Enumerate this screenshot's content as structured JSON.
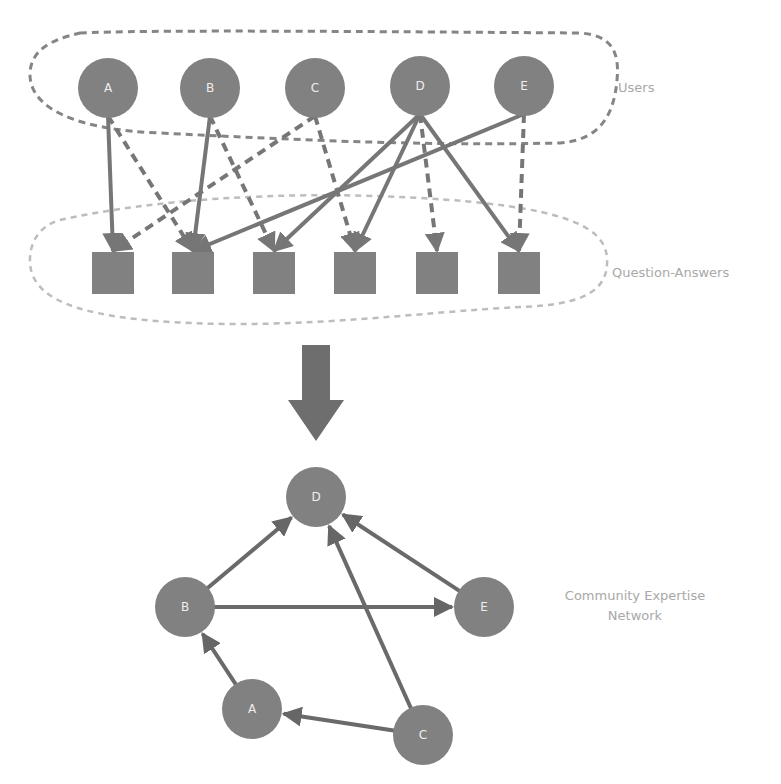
{
  "diagram": {
    "colors": {
      "node_fill": "#818181",
      "edge": "#767676",
      "edge_dark": "#6a6a6a",
      "users_outline": "#858585",
      "qa_outline": "#bdbdbd",
      "big_arrow": "#6e6e6e",
      "label_text": "#a8a8a8",
      "node_text": "#eeeeee"
    },
    "top_section": {
      "users_group": {
        "label": "Users",
        "nodes": [
          {
            "id": "A",
            "label": "A",
            "x": 108,
            "y": 88
          },
          {
            "id": "B",
            "label": "B",
            "x": 210,
            "y": 88
          },
          {
            "id": "C",
            "label": "C",
            "x": 315,
            "y": 88
          },
          {
            "id": "D",
            "label": "D",
            "x": 420,
            "y": 86
          },
          {
            "id": "E",
            "label": "E",
            "x": 524,
            "y": 86
          }
        ]
      },
      "qa_group": {
        "label": "Question-Answers",
        "items": [
          {
            "id": "Q1",
            "x": 113,
            "y": 273
          },
          {
            "id": "Q2",
            "x": 193,
            "y": 273
          },
          {
            "id": "Q3",
            "x": 274,
            "y": 273
          },
          {
            "id": "Q4",
            "x": 355,
            "y": 273
          },
          {
            "id": "Q5",
            "x": 437,
            "y": 273
          },
          {
            "id": "Q6",
            "x": 519,
            "y": 273
          }
        ]
      },
      "edges": [
        {
          "from": "A",
          "to": "Q1",
          "style": "solid"
        },
        {
          "from": "A",
          "to": "Q2",
          "style": "dashed"
        },
        {
          "from": "B",
          "to": "Q2",
          "style": "solid"
        },
        {
          "from": "B",
          "to": "Q3",
          "style": "dashed"
        },
        {
          "from": "C",
          "to": "Q1",
          "style": "dashed"
        },
        {
          "from": "C",
          "to": "Q4",
          "style": "dashed"
        },
        {
          "from": "D",
          "to": "Q3",
          "style": "solid"
        },
        {
          "from": "D",
          "to": "Q4",
          "style": "solid"
        },
        {
          "from": "D",
          "to": "Q5",
          "style": "dashed"
        },
        {
          "from": "D",
          "to": "Q6",
          "style": "solid"
        },
        {
          "from": "E",
          "to": "Q2",
          "style": "solid"
        },
        {
          "from": "E",
          "to": "Q6",
          "style": "dashed"
        }
      ]
    },
    "transform_arrow": {
      "direction": "down"
    },
    "bottom_section": {
      "label_line1": "Community Expertise",
      "label_line2": "Network",
      "nodes": [
        {
          "id": "D",
          "label": "D",
          "x": 316,
          "y": 497
        },
        {
          "id": "B",
          "label": "B",
          "x": 185,
          "y": 607
        },
        {
          "id": "E",
          "label": "E",
          "x": 484,
          "y": 607
        },
        {
          "id": "A",
          "label": "A",
          "x": 252,
          "y": 709
        },
        {
          "id": "C",
          "label": "C",
          "x": 423,
          "y": 735
        }
      ],
      "edges": [
        {
          "from": "B",
          "to": "D"
        },
        {
          "from": "E",
          "to": "D"
        },
        {
          "from": "C",
          "to": "D"
        },
        {
          "from": "B",
          "to": "E"
        },
        {
          "from": "A",
          "to": "B"
        },
        {
          "from": "C",
          "to": "A"
        }
      ]
    }
  }
}
